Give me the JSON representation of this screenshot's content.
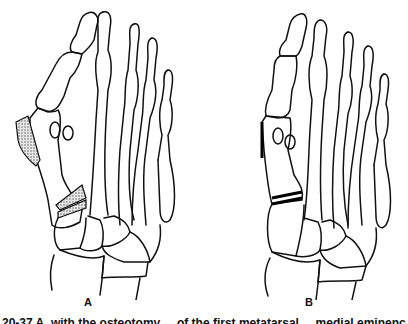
{
  "figure": {
    "panels": [
      {
        "label": "A",
        "description": "Foot skeleton with shaded wedge osteotomies at base of first metatarsal and medial eminence resection"
      },
      {
        "label": "B",
        "description": "Foot skeleton after correction with closed osteotomy lines at first metatarsal base"
      }
    ],
    "caption": "20-37  A, with the osteotomy ... of the first metatarsal ... medial eminence ...",
    "colors": {
      "line": "#111111",
      "background": "#ffffff",
      "shading": "#888888"
    }
  }
}
